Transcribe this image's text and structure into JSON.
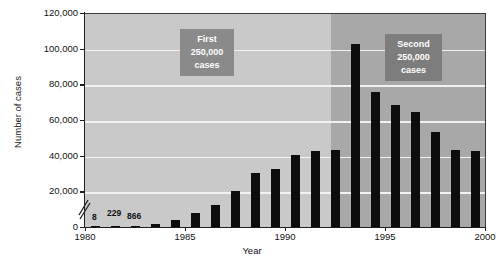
{
  "chart_data": {
    "type": "bar",
    "title": "",
    "xlabel": "Year",
    "ylabel": "Number of cases",
    "ylim": [
      0,
      120000
    ],
    "xlim": [
      1980,
      2000
    ],
    "grid": true,
    "legend_position": "none",
    "categories": [
      "1980",
      "1981",
      "1982",
      "1983",
      "1984",
      "1985",
      "1986",
      "1987",
      "1988",
      "1989",
      "1990",
      "1991",
      "1992",
      "1993",
      "1994",
      "1995",
      "1996",
      "1997",
      "1998",
      "1999"
    ],
    "values": [
      8,
      229,
      866,
      2100,
      4400,
      8200,
      13100,
      21000,
      31000,
      33000,
      41000,
      43000,
      44000,
      103000,
      76000,
      69000,
      65000,
      54000,
      44000,
      43000
    ],
    "ytick_labels": [
      "0",
      "20,000",
      "40,000",
      "60,000",
      "80,000",
      "100,000",
      "120,000"
    ],
    "ytick_values": [
      0,
      20000,
      40000,
      60000,
      80000,
      100000,
      120000
    ],
    "xtick_labels": [
      "1980",
      "1985",
      "1990",
      "1995",
      "2000"
    ],
    "xtick_values": [
      1980,
      1985,
      1990,
      1995,
      2000
    ],
    "axis_break": "y-axis break between 0 and 20,000",
    "data_labels": [
      {
        "category": "1980",
        "text": "8"
      },
      {
        "category": "1981",
        "text": "229"
      },
      {
        "category": "1982",
        "text": "866"
      }
    ],
    "annotations": [
      {
        "id": "first-period",
        "lines": [
          "First",
          "250,000",
          "cases"
        ],
        "region_start": 1980,
        "region_end": 1992
      },
      {
        "id": "second-period",
        "lines": [
          "Second",
          "250,000",
          "cases"
        ],
        "region_start": 1993,
        "region_end": 1999
      }
    ],
    "colors": {
      "bar": "#0d0d0d",
      "plot_background_left": "#c9c9c9",
      "plot_background_right": "#a8a8a8",
      "gridline": "#f2f2f2",
      "annotation_box": "#8a8a8a",
      "annotation_text": "#ffffff",
      "axis": "#1f1f1f",
      "text": "#111111"
    }
  }
}
